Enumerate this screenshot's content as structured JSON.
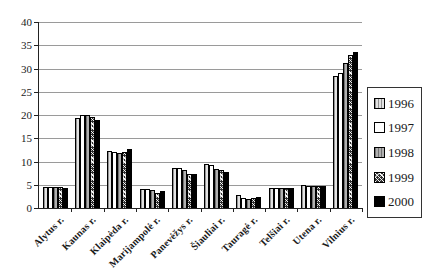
{
  "figure": {
    "background": "#ffffff",
    "axis_color": "#222222",
    "gridline_color": "#9a9a9a"
  },
  "chart_data": {
    "type": "bar",
    "title": "",
    "xlabel": "",
    "ylabel": "",
    "categories": [
      "Alytus r.",
      "Kaunas r.",
      "Klaipėda r.",
      "Marijampolė r.",
      "Panevėžys r.",
      "Šiauliai r.",
      "Tauragė r.",
      "Telšiai r.",
      "Utena r.",
      "Vilnius r."
    ],
    "series": [
      {
        "name": "1996",
        "pattern": "stipple-light",
        "values": [
          4.6,
          19.4,
          12.3,
          4.0,
          8.6,
          9.5,
          2.7,
          4.3,
          4.9,
          28.4
        ]
      },
      {
        "name": "1997",
        "pattern": "white",
        "values": [
          4.6,
          20.1,
          12.0,
          4.0,
          8.6,
          9.3,
          2.1,
          4.3,
          4.7,
          29.0
        ]
      },
      {
        "name": "1998",
        "pattern": "gray",
        "values": [
          4.5,
          19.9,
          11.9,
          3.9,
          8.1,
          8.4,
          2.0,
          4.2,
          4.7,
          31.2
        ]
      },
      {
        "name": "1999",
        "pattern": "crosshatch",
        "values": [
          4.5,
          19.6,
          12.1,
          3.3,
          7.3,
          8.2,
          2.1,
          4.2,
          4.7,
          33.0
        ]
      },
      {
        "name": "2000",
        "pattern": "black",
        "values": [
          4.4,
          19.0,
          12.6,
          3.6,
          7.4,
          7.8,
          2.4,
          4.3,
          4.7,
          33.5
        ]
      }
    ],
    "ylim": [
      0,
      40
    ],
    "ytick_step": 5,
    "yticks": [
      "0",
      "5",
      "10",
      "15",
      "20",
      "25",
      "30",
      "35",
      "40"
    ],
    "grid": true,
    "legend_position": "right"
  }
}
